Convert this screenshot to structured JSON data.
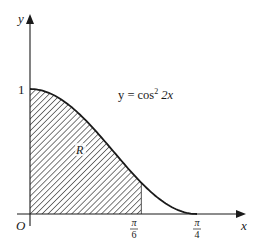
{
  "figure": {
    "type": "area-under-curve",
    "function": "y = cos^2(2x)",
    "axes": {
      "x_label": "x",
      "y_label": "y",
      "origin_label": "O",
      "y_tick_label": "1",
      "x_ticks": [
        {
          "numerator": "π",
          "denominator": "6",
          "value": 0.5236
        },
        {
          "numerator": "π",
          "denominator": "4",
          "value": 0.7854
        }
      ]
    },
    "curve_label": {
      "prefix": "y = cos",
      "superscript": "2",
      "suffix": " 2x"
    },
    "region": {
      "label": "R",
      "x_from": 0,
      "x_to": "π/6",
      "fill": "hatched"
    },
    "colors": {
      "ink": "#1a1a1a",
      "background": "#ffffff"
    }
  }
}
